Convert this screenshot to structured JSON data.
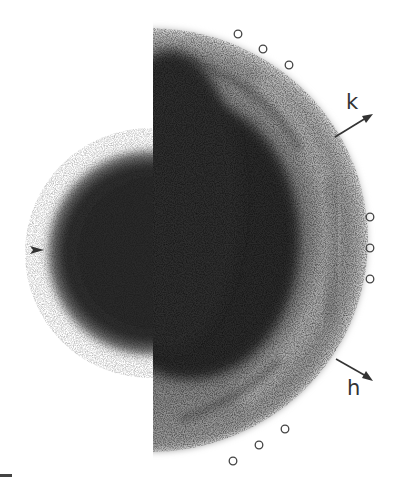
{
  "figure": {
    "type": "diffraction-pattern",
    "axis_labels": {
      "k": "k",
      "h": "h"
    },
    "marker_type": "open-circle",
    "markers": [
      {
        "x": 238,
        "y": 34
      },
      {
        "x": 263,
        "y": 49
      },
      {
        "x": 289,
        "y": 65
      },
      {
        "x": 370,
        "y": 217
      },
      {
        "x": 370,
        "y": 248
      },
      {
        "x": 370,
        "y": 279
      },
      {
        "x": 285,
        "y": 429
      },
      {
        "x": 259,
        "y": 445
      },
      {
        "x": 233,
        "y": 461
      }
    ],
    "pointer": {
      "x": 40,
      "y": 250,
      "direction": "right"
    },
    "scale_bar": {
      "x": 0,
      "y": 474,
      "width": 12
    }
  },
  "colors": {
    "blob": "#2b2b2b",
    "ink": "#333333",
    "background": "#ffffff"
  }
}
